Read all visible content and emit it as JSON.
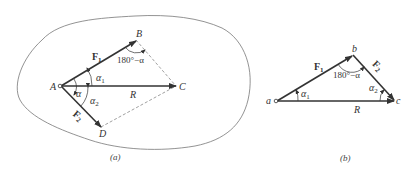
{
  "figure_a": {
    "caption": "(a)",
    "points": {
      "A": "A",
      "B": "B",
      "C": "C",
      "D": "D"
    },
    "vectors": {
      "F1": "F",
      "F1_sub": "1",
      "F2": "F",
      "F2_sub": "2",
      "R": "R"
    },
    "angles": {
      "alpha": "α",
      "alpha1": "α",
      "alpha1_sub": "1",
      "alpha2": "α",
      "alpha2_sub": "2",
      "supplement": "180°−α"
    }
  },
  "figure_b": {
    "caption": "(b)",
    "points": {
      "a": "a",
      "b": "b",
      "c": "c"
    },
    "vectors": {
      "F1": "F",
      "F1_sub": "1",
      "F2": "F",
      "F2_sub": "2",
      "R": "R"
    },
    "angles": {
      "alpha1": "α",
      "alpha1_sub": "1",
      "alpha2": "α",
      "alpha2_sub": "2",
      "supplement": "180°−α"
    }
  },
  "colors": {
    "line": "#333333",
    "dashed": "#777777",
    "boundary": "#777777"
  }
}
